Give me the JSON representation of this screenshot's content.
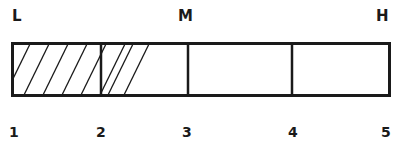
{
  "diagram": {
    "type": "segmented-scale-bar",
    "top_labels": [
      {
        "text": "L",
        "position": 1
      },
      {
        "text": "M",
        "position": 3
      },
      {
        "text": "H",
        "position": 5
      }
    ],
    "tick_labels": [
      "1",
      "2",
      "3",
      "4",
      "5"
    ],
    "segments": [
      {
        "from": 1,
        "to": 2,
        "hatched": "full"
      },
      {
        "from": 2,
        "to": 3,
        "hatched": "partial"
      },
      {
        "from": 3,
        "to": 4,
        "hatched": "none"
      },
      {
        "from": 4,
        "to": 5,
        "hatched": "none"
      }
    ],
    "hatched_extent_approx": 2.6,
    "line_color": "#1a1a1a",
    "background": "#ffffff"
  }
}
